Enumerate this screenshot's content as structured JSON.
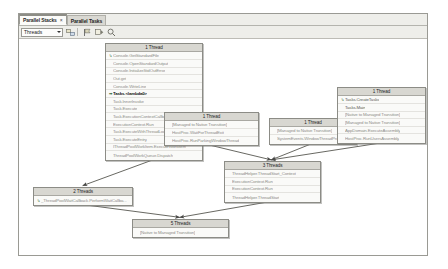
{
  "window": {
    "title": "Parallel Stacks"
  },
  "tabs": [
    {
      "label": "Parallel Stacks",
      "active": true,
      "closable": true,
      "close_glyph": "×"
    },
    {
      "label": "Parallel Tasks",
      "active": false,
      "closable": false,
      "close_glyph": ""
    }
  ],
  "toolbar": {
    "view_selector": {
      "value": "Threads",
      "caret": "▾"
    },
    "buttons": [
      {
        "name": "toggle-method-view-button",
        "icon": "method-view-icon"
      },
      {
        "name": "show-only-flagged-button",
        "icon": "flag-icon"
      },
      {
        "name": "auto-scroll-button",
        "icon": "auto-scroll-icon"
      },
      {
        "name": "zoom-control-button",
        "icon": "zoom-icon"
      }
    ]
  },
  "graph": {
    "nodes": [
      {
        "id": "node-main-thread",
        "name": "stack-node-main-thread",
        "header": "1 Thread",
        "x": 86,
        "y": 4,
        "w": 98,
        "frames": [
          {
            "text": "Console.GetStandardFile",
            "gutter": "↳",
            "style": "normal"
          },
          {
            "text": "Console.OpenStandardOutput",
            "gutter": "",
            "style": "normal"
          },
          {
            "text": "Console.InitializeStdOutError",
            "gutter": "",
            "style": "normal"
          },
          {
            "text": "Out.get",
            "gutter": "",
            "style": "normal"
          },
          {
            "text": "Console.WriteLine",
            "gutter": "",
            "style": "normal"
          },
          {
            "text": "Tasks.<lambda0>",
            "gutter": "⇒",
            "style": "current"
          },
          {
            "text": "Task.InnerInvoke",
            "gutter": "",
            "style": "normal"
          },
          {
            "text": "Task.Execute",
            "gutter": "",
            "style": "normal"
          },
          {
            "text": "Task.ExecutionContextCallback",
            "gutter": "",
            "style": "normal"
          },
          {
            "text": "ExecutionContext.Run",
            "gutter": "",
            "style": "normal"
          },
          {
            "text": "Task.ExecuteWithThreadLocal",
            "gutter": "",
            "style": "normal"
          },
          {
            "text": "Task.ExecuteEntry",
            "gutter": "",
            "style": "normal"
          },
          {
            "text": "IThreadPoolWorkItem.ExecuteWorkItem",
            "gutter": "",
            "style": "normal"
          },
          {
            "text": "ThreadPoolWorkQueue.Dispatch",
            "gutter": "",
            "style": "normal"
          }
        ]
      },
      {
        "id": "node-two-threads",
        "name": "stack-node-two-threads",
        "header": "2 Threads",
        "x": 14,
        "y": 148,
        "w": 100,
        "frames": [
          {
            "text": "_ThreadPoolWaitCallback.PerformWaitCallba...",
            "gutter": "↳",
            "style": "normal"
          }
        ]
      },
      {
        "id": "node-parking-window",
        "name": "stack-node-parking-window",
        "header": "1 Thread",
        "x": 145,
        "y": 73,
        "w": 95,
        "frames": [
          {
            "text": "[Managed to Native Transition]",
            "gutter": "",
            "style": "normal"
          },
          {
            "text": "HostProc.WaitForThreadExit",
            "gutter": "",
            "style": "normal"
          },
          {
            "text": "HostProc.RunParkingWindowThread",
            "gutter": "",
            "style": "normal"
          }
        ]
      },
      {
        "id": "node-system-events",
        "name": "stack-node-system-events",
        "header": "1 Thread",
        "x": 250,
        "y": 79,
        "w": 88,
        "frames": [
          {
            "text": "[Managed to Native Transition]",
            "gutter": "",
            "style": "normal"
          },
          {
            "text": "SystemEvents.WindowThreadProc",
            "gutter": "",
            "style": "normal"
          }
        ]
      },
      {
        "id": "node-three-threads",
        "name": "stack-node-three-threads",
        "header": "3 Threads",
        "x": 205,
        "y": 122,
        "w": 97,
        "frames": [
          {
            "text": "ThreadHelper.ThreadStart_Context",
            "gutter": "",
            "style": "normal"
          },
          {
            "text": "ExecutionContext.Run",
            "gutter": "",
            "style": "normal"
          },
          {
            "text": "ExecutionContext.Run",
            "gutter": "",
            "style": "normal"
          },
          {
            "text": "ThreadHelper.ThreadStart",
            "gutter": "",
            "style": "normal"
          }
        ]
      },
      {
        "id": "node-five-threads",
        "name": "stack-node-five-threads",
        "header": "5 Threads",
        "x": 113,
        "y": 180,
        "w": 97,
        "frames": [
          {
            "text": "[Native to Managed Transition]",
            "gutter": "",
            "style": "normal"
          }
        ]
      },
      {
        "id": "node-create-tasks",
        "name": "stack-node-create-tasks",
        "header": "1 Thread",
        "x": 318,
        "y": 48,
        "w": 89,
        "frames": [
          {
            "text": "Tasks.CreateTasks",
            "gutter": "↳",
            "style": "dark"
          },
          {
            "text": "Tasks.Main",
            "gutter": "",
            "style": "dark"
          },
          {
            "text": "[Native to Managed Transition]",
            "gutter": "",
            "style": "normal"
          },
          {
            "text": "[Managed to Native Transition]",
            "gutter": "",
            "style": "normal"
          },
          {
            "text": "AppDomain.ExecuteAssembly",
            "gutter": "",
            "style": "normal"
          },
          {
            "text": "HostProc.RunUsersAssembly",
            "gutter": "",
            "style": "normal"
          }
        ]
      }
    ],
    "edges": [
      {
        "name": "edge-parking-to-three",
        "from": "node-parking-window",
        "to": "node-three-threads"
      },
      {
        "name": "edge-system-to-three",
        "from": "node-system-events",
        "to": "node-three-threads"
      },
      {
        "name": "edge-create-to-three",
        "from": "node-create-tasks",
        "to": "node-three-threads"
      },
      {
        "name": "edge-three-to-five",
        "from": "node-three-threads",
        "to": "node-five-threads"
      },
      {
        "name": "edge-two-to-five",
        "from": "node-two-threads",
        "to": "node-five-threads"
      },
      {
        "name": "edge-main-to-two",
        "from": "node-main-thread",
        "to": "node-two-threads"
      }
    ]
  },
  "colors": {
    "window_chrome": "#f3f2ef",
    "node_header": "#d8d7d1",
    "node_body": "#fafaf8",
    "node_border": "#8c8c86",
    "frame_text": "#8f8e8a",
    "current_frame_text": "#111111",
    "edge": "#555555",
    "canvas": "#ffffff"
  }
}
